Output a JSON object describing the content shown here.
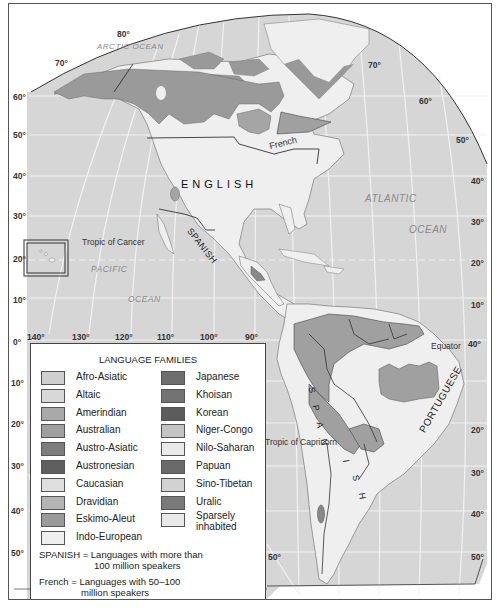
{
  "map": {
    "title": "Language families of the Americas",
    "ocean_labels": {
      "arctic": "ARCTIC OCEAN",
      "atlantic_1": "ATLANTIC",
      "atlantic_2": "OCEAN",
      "pacific_1": "PACIFIC",
      "pacific_2": "OCEAN"
    },
    "language_labels": {
      "english": "ENGLISH",
      "french": "French",
      "spanish_mexico": "SPANISH",
      "spanish_south": [
        "S",
        "P",
        "A",
        "N",
        "I",
        "S",
        "H"
      ],
      "portuguese": "PORTUGUESE"
    },
    "reference_lines": {
      "tropic_cancer": "Tropic of Cancer",
      "tropic_capricorn": "Tropic of Capricorn",
      "equator": "Equator"
    },
    "latitude_labels_left": [
      "70°",
      "60°",
      "50°",
      "40°",
      "30°",
      "20°",
      "10°",
      "0°",
      "10°",
      "20°",
      "30°",
      "40°",
      "50°"
    ],
    "latitude_labels_right": [
      "70°",
      "60°",
      "50°",
      "40°",
      "30°",
      "20°",
      "10°",
      "20°",
      "30°",
      "40°",
      "50°"
    ],
    "longitude_labels": [
      "140°",
      "130°",
      "120°",
      "110°",
      "100°",
      "90°",
      "40°"
    ],
    "top_label": "80°",
    "south_left_50": "50°",
    "colors": {
      "ocean": "#d6d6d6",
      "land_indo_european": "#efefef",
      "amerindian": "#a8a8a8",
      "eskimo_aleut": "#999999",
      "graticule": "#f4f4f4",
      "border": "#3a3a3a"
    }
  },
  "legend": {
    "title": "LANGUAGE FAMILIES",
    "left_column": [
      {
        "label": "Afro-Asiatic",
        "color": "#cfcfcf"
      },
      {
        "label": "Altaic",
        "color": "#d8d8d8"
      },
      {
        "label": "Amerindian",
        "color": "#a9a9a9"
      },
      {
        "label": "Australian",
        "color": "#9f9f9f"
      },
      {
        "label": "Austro-Asiatic",
        "color": "#7d7d7d"
      },
      {
        "label": "Austronesian",
        "color": "#5f5f5f"
      },
      {
        "label": "Caucasian",
        "color": "#dedede"
      },
      {
        "label": "Dravidian",
        "color": "#b4b4b4"
      },
      {
        "label": "Eskimo-Aleut",
        "color": "#9a9a9a"
      },
      {
        "label": "Indo-European",
        "color": "#efefef"
      }
    ],
    "right_column": [
      {
        "label": "Japanese",
        "color": "#6e6e6e"
      },
      {
        "label": "Khoisan",
        "color": "#737373"
      },
      {
        "label": "Korean",
        "color": "#5c5c5c"
      },
      {
        "label": "Niger-Congo",
        "color": "#c4c4c4"
      },
      {
        "label": "Nilo-Saharan",
        "color": "#e9e9e9"
      },
      {
        "label": "Papuan",
        "color": "#6a6a6a"
      },
      {
        "label": "Sino-Tibetan",
        "color": "#d2d2d2"
      },
      {
        "label": "Uralic",
        "color": "#7a7a7a"
      },
      {
        "label": "Sparsely\ninhabited",
        "color": "#e8e8e8"
      }
    ],
    "note_spanish_1": "SPANISH = Languages with more than",
    "note_spanish_2": "100 million speakers",
    "note_french_1": "French = Languages with 50–100",
    "note_french_2": "million speakers"
  }
}
